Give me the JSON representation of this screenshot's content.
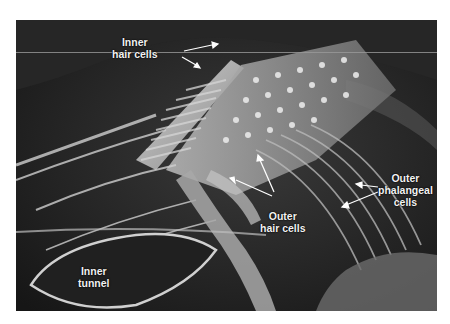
{
  "figure": {
    "type": "scanning electron micrograph",
    "labels": [
      {
        "id": "inner-hair-cells",
        "lines": [
          "Inner",
          "hair cells"
        ]
      },
      {
        "id": "outer-phalangeal-cells",
        "lines": [
          "Outer",
          "phalangeal",
          "cells"
        ]
      },
      {
        "id": "outer-hair-cells",
        "lines": [
          "Outer",
          "hair cells"
        ]
      },
      {
        "id": "inner-tunnel",
        "lines": [
          "Inner",
          "tunnel"
        ]
      }
    ],
    "colors": {
      "background": "#ffffff",
      "micrograph_dark": "#1e1e1e",
      "micrograph_light": "#e0e0e0",
      "label_text": "#f2f2f2"
    }
  }
}
